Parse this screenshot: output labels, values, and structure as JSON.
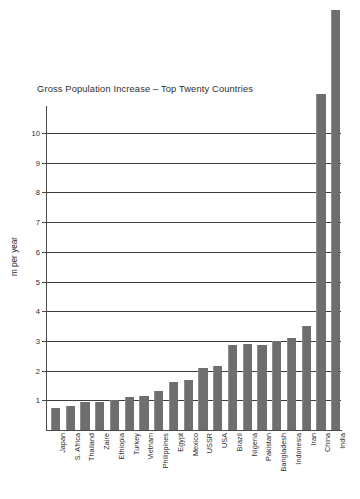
{
  "chart_data": {
    "type": "bar",
    "title": "Gross Population Increase – Top Twenty Countries",
    "xlabel": "",
    "ylabel": "m per year",
    "ylim": [
      0,
      14.5
    ],
    "grid": true,
    "legend": "none",
    "axis_tick_labels": [
      "1",
      "2",
      "3",
      "4",
      "5",
      "6",
      "7",
      "8",
      "9",
      "10"
    ],
    "axis_tick_values": [
      1,
      2,
      3,
      4,
      5,
      6,
      7,
      8,
      9,
      10
    ],
    "categories": [
      "Japan",
      "S. Africa",
      "Thailand",
      "Zaire",
      "Ethiopia",
      "Turkey",
      "Vietnam",
      "Philippines",
      "Egypt",
      "Mexico",
      "USSR",
      "USA",
      "Brazil",
      "Nigeria",
      "Pakistan",
      "Bangladesh",
      "Indonesia",
      "Iran",
      "China",
      "India"
    ],
    "values": [
      0.75,
      0.8,
      0.95,
      0.95,
      1.0,
      1.1,
      1.15,
      1.3,
      1.6,
      1.7,
      2.1,
      2.15,
      2.85,
      2.9,
      2.85,
      3.0,
      3.1,
      3.5,
      11.3,
      14.15
    ]
  }
}
